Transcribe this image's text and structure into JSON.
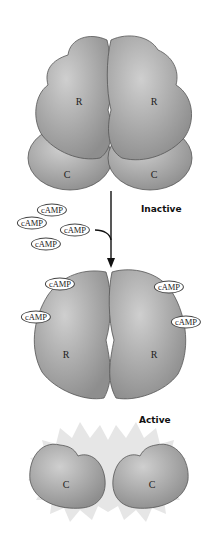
{
  "diagram": {
    "inactive_complex": {
      "regulatory_labels": [
        "R",
        "R"
      ],
      "catalytic_labels": [
        "C",
        "C"
      ],
      "state_label": "Inactive"
    },
    "free_camp": [
      "cAMP",
      "cAMP",
      "cAMP",
      "cAMP"
    ],
    "active_complex": {
      "regulatory_labels": [
        "R",
        "R"
      ],
      "bound_camp": [
        "cAMP",
        "cAMP",
        "cAMP",
        "cAMP"
      ],
      "state_label": "Active"
    },
    "free_catalytic": [
      "C",
      "C"
    ],
    "colors": {
      "protein_fill": "#9a9a9a",
      "protein_light": "#c4c4c4",
      "outline": "#555555",
      "starburst": "#e6e6e6"
    }
  }
}
